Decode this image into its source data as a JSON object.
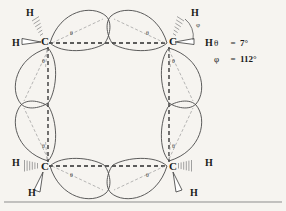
{
  "figure": {
    "type": "chemical-structure-diagram",
    "background_color": "#f6f4f0",
    "ink_color": "#1b1b1b"
  },
  "legend": {
    "rows": [
      {
        "symbol": "θ",
        "equals": "=",
        "value": "7°"
      },
      {
        "symbol": "φ",
        "equals": "=",
        "value": "112°"
      }
    ]
  },
  "atoms": {
    "carbons": [
      {
        "id": "c-top-left",
        "label": "C",
        "x": 44,
        "y": 42
      },
      {
        "id": "c-top-right",
        "label": "C",
        "x": 172,
        "y": 42
      },
      {
        "id": "c-bottom-left",
        "label": "C",
        "x": 44,
        "y": 167
      },
      {
        "id": "c-bottom-right",
        "label": "C",
        "x": 172,
        "y": 167
      }
    ],
    "hydrogens": [
      {
        "id": "h-top-left-upper",
        "label": "H",
        "x": 27,
        "y": 13
      },
      {
        "id": "h-top-left-outer",
        "label": "H",
        "x": 13,
        "y": 44
      },
      {
        "id": "h-top-right-upper",
        "label": "H",
        "x": 193,
        "y": 13
      },
      {
        "id": "h-top-right-outer",
        "label": "H",
        "x": 208,
        "y": 44
      },
      {
        "id": "h-bottom-left-outer",
        "label": "H",
        "x": 13,
        "y": 163
      },
      {
        "id": "h-bottom-left-lower",
        "label": "H",
        "x": 29,
        "y": 194
      },
      {
        "id": "h-bottom-right-outer",
        "label": "H",
        "x": 207,
        "y": 163
      },
      {
        "id": "h-bottom-right-lower",
        "label": "H",
        "x": 192,
        "y": 194
      }
    ]
  },
  "angle_labels": {
    "theta": "θ",
    "phi": "φ",
    "theta_markers": [
      {
        "id": "theta-top-left",
        "x": 70,
        "y": 33
      },
      {
        "id": "theta-top-right",
        "x": 150,
        "y": 33
      },
      {
        "id": "theta-left-upper",
        "x": 45,
        "y": 62
      },
      {
        "id": "theta-left-lower",
        "x": 45,
        "y": 145
      },
      {
        "id": "theta-right-upper",
        "x": 170,
        "y": 62
      },
      {
        "id": "theta-right-lower",
        "x": 170,
        "y": 145
      },
      {
        "id": "theta-bottom-left",
        "x": 70,
        "y": 174
      },
      {
        "id": "theta-bottom-right",
        "x": 150,
        "y": 174
      }
    ],
    "phi_markers": [
      {
        "id": "phi-top-right",
        "x": 196,
        "y": 26
      }
    ]
  }
}
